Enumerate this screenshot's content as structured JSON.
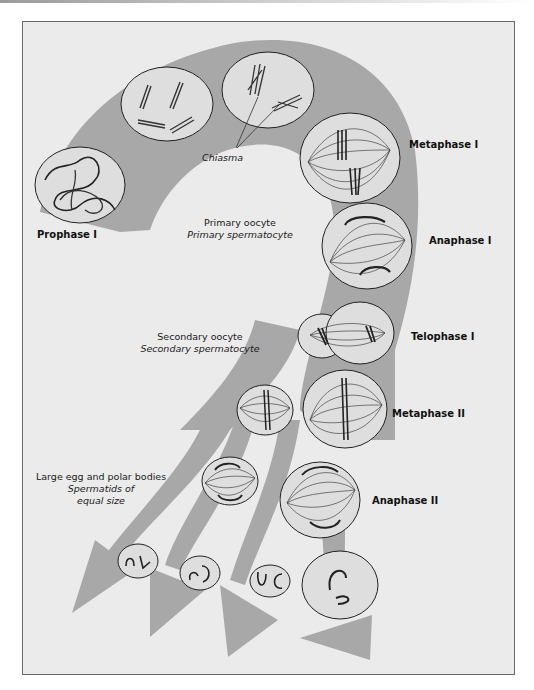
{
  "diagram": {
    "type": "meiosis-flow",
    "colors": {
      "background": "#ebebeb",
      "arrow_band": "#a8a8a8",
      "cell_fill": "#dedede",
      "cell_stroke": "#222222",
      "frame": "#6a6a6a"
    },
    "phases": [
      {
        "id": "prophase-1",
        "label": "Prophase I"
      },
      {
        "id": "metaphase-1",
        "label": "Metaphase I"
      },
      {
        "id": "anaphase-1",
        "label": "Anaphase I"
      },
      {
        "id": "telophase-1",
        "label": "Telophase I"
      },
      {
        "id": "metaphase-2",
        "label": "Metaphase II"
      },
      {
        "id": "anaphase-2",
        "label": "Anaphase II"
      }
    ],
    "annotations": {
      "chiasma": "Chiasma",
      "primary_line1": "Primary oocyte",
      "primary_line2": "Primary spermatocyte",
      "secondary_line1": "Secondary oocyte",
      "secondary_line2": "Secondary spermatocyte",
      "final_line1": "Large egg and polar bodies",
      "final_line2": "Spermatids of",
      "final_line3": "equal size"
    }
  }
}
